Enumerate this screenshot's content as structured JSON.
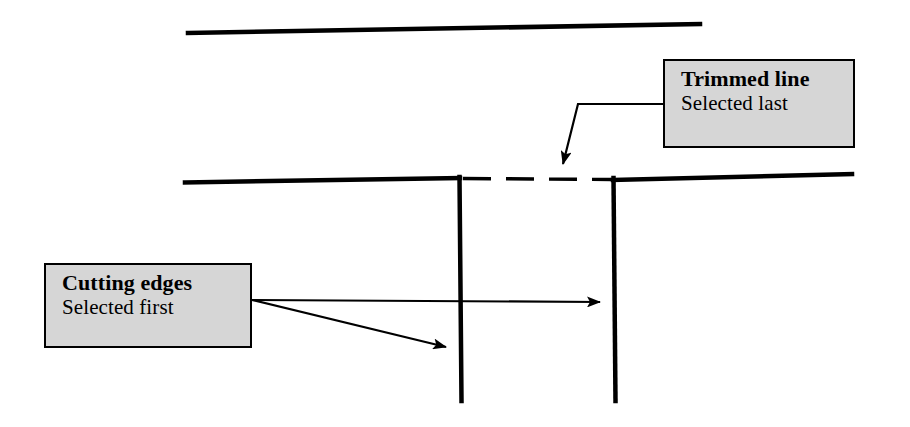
{
  "diagram": {
    "background_color": "#ffffff",
    "line_color": "#000000",
    "callout_fill_color": "#d6d6d6",
    "callout_border_color": "#000000"
  },
  "callouts": [
    {
      "id": "trimmed-line",
      "title": "Trimmed line",
      "subtitle": "Selected last",
      "x": 663,
      "y": 59,
      "width": 192,
      "height": 89
    },
    {
      "id": "cutting-edges",
      "title": "Cutting edges",
      "subtitle": "Selected first",
      "x": 44,
      "y": 263,
      "width": 208,
      "height": 85
    }
  ],
  "geometry": {
    "top_line": {
      "name": "top-horizontal-line",
      "x1": 188,
      "y1": 33,
      "x2": 700,
      "y2": 24,
      "width": 4
    },
    "left_horizontal": {
      "name": "left-horizontal-line",
      "x1": 185,
      "y1": 182,
      "x2": 459,
      "y2": 178,
      "width": 4
    },
    "right_horizontal": {
      "name": "right-horizontal-line",
      "x1": 613,
      "y1": 180,
      "x2": 852,
      "y2": 174,
      "width": 4
    },
    "left_vertical": {
      "name": "left-vertical-cutting-edge",
      "x1": 459,
      "y1": 178,
      "x2": 461,
      "y2": 400,
      "width": 4
    },
    "right_vertical": {
      "name": "right-vertical-cutting-edge",
      "x1": 613,
      "y1": 180,
      "x2": 615,
      "y2": 400,
      "width": 4
    },
    "trimmed_segment": {
      "name": "trimmed-dashed-segment",
      "x1": 462,
      "y1": 178,
      "x2": 612,
      "y2": 179,
      "width": 3,
      "dash": "28 15"
    }
  },
  "leaders": [
    {
      "name": "trimmed-line-leader",
      "points": "665,104 578,104 566,163",
      "arrow_tip": {
        "x": 565,
        "y": 174
      },
      "arrow_angle_deg": 101
    },
    {
      "name": "cutting-edge-leader-right",
      "points": "252,300 600,302",
      "arrow_tip": {
        "x": 612,
        "y": 302
      },
      "arrow_angle_deg": 0
    },
    {
      "name": "cutting-edge-leader-left",
      "points": "252,300 447,347",
      "arrow_tip": {
        "x": 458,
        "y": 350
      },
      "arrow_angle_deg": 14
    }
  ]
}
